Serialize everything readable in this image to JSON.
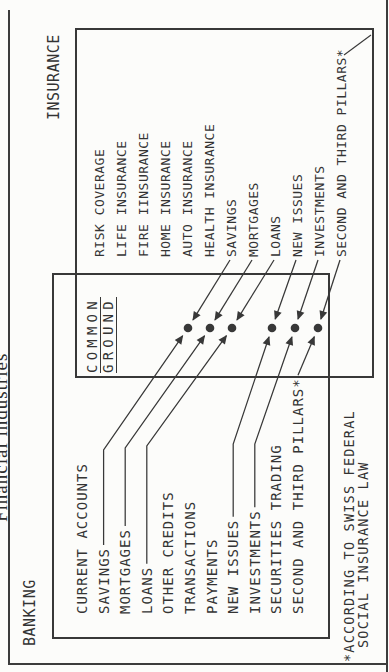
{
  "title": "Financial industries",
  "colors": {
    "ink": "#383838",
    "background": "#fcfcfa"
  },
  "banking": {
    "label": "BANKING",
    "items": [
      {
        "label": "CURRENT ACCOUNTS",
        "linked": false
      },
      {
        "label": "SAVINGS",
        "linked": true
      },
      {
        "label": "MORTGAGES",
        "linked": true
      },
      {
        "label": "LOANS",
        "linked": true
      },
      {
        "label": "OTHER CREDITS",
        "linked": false
      },
      {
        "label": "TRANSACTIONS",
        "linked": false
      },
      {
        "label": "PAYMENTS",
        "linked": false
      },
      {
        "label": "NEW ISSUES",
        "linked": true
      },
      {
        "label": "INVESTMENTS",
        "linked": true
      },
      {
        "label": "SECURITIES TRADING",
        "linked": false
      },
      {
        "label": "SECOND AND THIRD PILLARS*",
        "linked": true
      }
    ]
  },
  "insurance": {
    "label": "INSURANCE",
    "items": [
      {
        "label": "RISK COVERAGE",
        "linked": false
      },
      {
        "label": "LIFE INSURANCE",
        "linked": false
      },
      {
        "label": "FIRE IINSURANCE",
        "linked": false
      },
      {
        "label": "HOME INSURANCE",
        "linked": false
      },
      {
        "label": "AUTO INSURANCE",
        "linked": false
      },
      {
        "label": "HEALTH INSURANCE",
        "linked": false
      },
      {
        "label": "SAVINGS",
        "linked": true
      },
      {
        "label": "MORTGAGES",
        "linked": true
      },
      {
        "label": "LOANS",
        "linked": true
      },
      {
        "label": "NEW ISSUES",
        "linked": true
      },
      {
        "label": "INVESTMENTS",
        "linked": true
      },
      {
        "label": "SECOND AND THIRD PILLARS*",
        "linked": true
      }
    ]
  },
  "common_ground": {
    "line1": "COMMON",
    "line2": "GROUND",
    "dot_count": 6
  },
  "footnote": {
    "line1": "*ACCORDING TO SWISS FEDERAL",
    "line2": "SOCIAL INSURANCE LAW"
  }
}
